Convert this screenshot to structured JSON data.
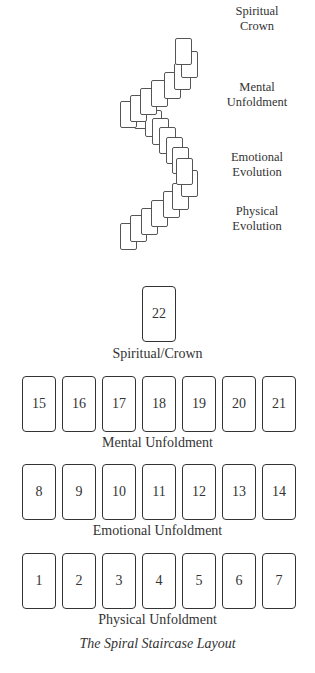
{
  "spiral": {
    "labels": [
      {
        "line1": "Spiritual",
        "line2": "Crown",
        "x": 216,
        "y": 4
      },
      {
        "line1": "Mental",
        "line2": "Unfoldment",
        "x": 216,
        "y": 80
      },
      {
        "line1": "Emotional",
        "line2": "Evolution",
        "x": 216,
        "y": 150
      },
      {
        "line1": "Physical",
        "line2": "Evolution",
        "x": 216,
        "y": 204
      }
    ],
    "cards": [
      {
        "n": 1,
        "x": 120,
        "y": 223
      },
      {
        "n": 2,
        "x": 130,
        "y": 215
      },
      {
        "n": 3,
        "x": 141,
        "y": 208
      },
      {
        "n": 4,
        "x": 151,
        "y": 200
      },
      {
        "n": 5,
        "x": 163,
        "y": 191
      },
      {
        "n": 6,
        "x": 172,
        "y": 183
      },
      {
        "n": 7,
        "x": 181,
        "y": 170
      },
      {
        "n": 8,
        "x": 176,
        "y": 158
      },
      {
        "n": 9,
        "x": 172,
        "y": 147
      },
      {
        "n": 10,
        "x": 166,
        "y": 137
      },
      {
        "n": 11,
        "x": 159,
        "y": 127
      },
      {
        "n": 12,
        "x": 152,
        "y": 118
      },
      {
        "n": 13,
        "x": 145,
        "y": 110
      },
      {
        "n": 14,
        "x": 134,
        "y": 102
      },
      {
        "n": 15,
        "x": 120,
        "y": 101
      },
      {
        "n": 16,
        "x": 130,
        "y": 95
      },
      {
        "n": 17,
        "x": 140,
        "y": 88
      },
      {
        "n": 18,
        "x": 151,
        "y": 80
      },
      {
        "n": 19,
        "x": 164,
        "y": 72
      },
      {
        "n": 20,
        "x": 174,
        "y": 63
      },
      {
        "n": 21,
        "x": 181,
        "y": 51
      },
      {
        "n": 22,
        "x": 175,
        "y": 38
      }
    ]
  },
  "layout": {
    "crown": {
      "card": "22",
      "label": "Spiritual/Crown"
    },
    "rows": [
      {
        "label": "Mental Unfoldment",
        "cards": [
          "15",
          "16",
          "17",
          "18",
          "19",
          "20",
          "21"
        ],
        "top": 376,
        "label_top": 435
      },
      {
        "label": "Emotional Unfoldment",
        "cards": [
          "8",
          "9",
          "10",
          "11",
          "12",
          "13",
          "14"
        ],
        "top": 464,
        "label_top": 523
      },
      {
        "label": "Physical Unfoldment",
        "cards": [
          "1",
          "2",
          "3",
          "4",
          "5",
          "6",
          "7"
        ],
        "top": 553,
        "label_top": 612
      }
    ],
    "caption": "The Spiral Staircase Layout"
  }
}
